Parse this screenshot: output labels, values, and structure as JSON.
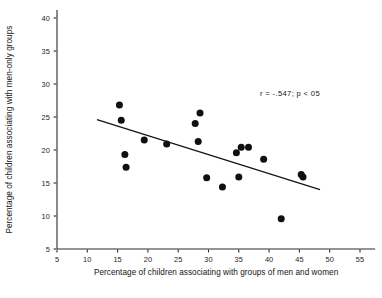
{
  "chart_data": {
    "type": "scatter",
    "title": "",
    "xlabel": "Percentage of children associating with groups of men and women",
    "ylabel": "Percentage of children associating  with men-only groups",
    "xlim": [
      5,
      57
    ],
    "ylim": [
      3,
      41
    ],
    "xticks": [
      5,
      10,
      15,
      20,
      25,
      30,
      35,
      40,
      45,
      50,
      55
    ],
    "yticks": [
      5,
      10,
      15,
      20,
      25,
      30,
      35,
      40
    ],
    "xtick_labels": [
      "5",
      "10",
      "15",
      "20",
      "25",
      "30",
      "35",
      "40",
      "45",
      "50",
      "55"
    ],
    "ytick_labels": [
      "5",
      "10",
      "15",
      "20",
      "25",
      "30",
      "35",
      "40"
    ],
    "grid": false,
    "legend": "none",
    "annotation": "r  =  -.547; p < 05",
    "annotation_x": 38.5,
    "annotation_y": 28.2,
    "points": [
      {
        "x": 15.3,
        "y": 26.8
      },
      {
        "x": 15.6,
        "y": 24.5
      },
      {
        "x": 16.2,
        "y": 19.3
      },
      {
        "x": 16.4,
        "y": 17.4
      },
      {
        "x": 19.4,
        "y": 21.5
      },
      {
        "x": 23.1,
        "y": 20.9
      },
      {
        "x": 27.8,
        "y": 24.0
      },
      {
        "x": 28.6,
        "y": 25.6
      },
      {
        "x": 28.3,
        "y": 21.3
      },
      {
        "x": 29.7,
        "y": 15.8
      },
      {
        "x": 32.3,
        "y": 14.4
      },
      {
        "x": 34.6,
        "y": 19.6
      },
      {
        "x": 35.4,
        "y": 20.4
      },
      {
        "x": 36.6,
        "y": 20.4
      },
      {
        "x": 35.0,
        "y": 15.9
      },
      {
        "x": 39.1,
        "y": 18.6
      },
      {
        "x": 42.0,
        "y": 9.6
      },
      {
        "x": 45.3,
        "y": 16.3
      },
      {
        "x": 45.6,
        "y": 15.9
      }
    ],
    "trendline": {
      "x_start": 11.6,
      "y_start": 24.6,
      "x_end": 48.4,
      "y_end": 14.0,
      "r": -0.547,
      "p_text": "p < 05"
    }
  }
}
